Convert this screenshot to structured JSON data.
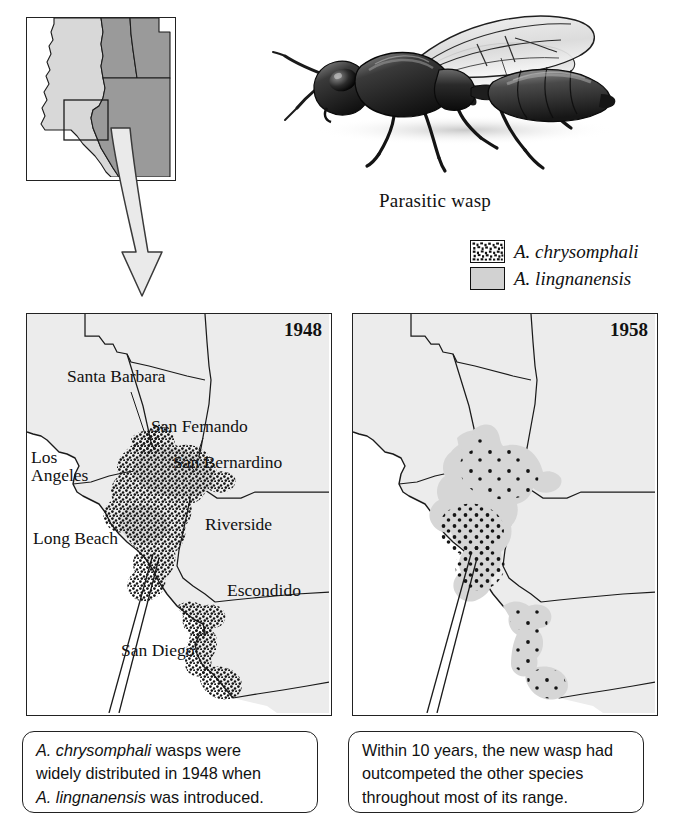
{
  "figure": {
    "type": "two-panel distribution map with inset locator and illustration"
  },
  "illustration": {
    "name": "parasitic-wasp-drawing",
    "caption": "Parasitic wasp"
  },
  "legend": {
    "items": [
      {
        "swatch": "stipple-pattern",
        "label": "A. chrysomphali"
      },
      {
        "swatch": "gray-fill",
        "label": "A. lingnanensis"
      }
    ]
  },
  "locator_map": {
    "name": "southwest-us-locator",
    "inset_box": "southern California study area",
    "states": [
      "California",
      "Nevada",
      "Utah",
      "Arizona"
    ]
  },
  "panels": [
    {
      "id": "panel-1948",
      "year": "1948",
      "cities": [
        {
          "label": "Santa Barbara",
          "x": 40,
          "y": 57
        },
        {
          "label": "San Fernando",
          "x": 125,
          "y": 107
        },
        {
          "label": "San Bernardino",
          "x": 145,
          "y": 142
        },
        {
          "label": "Los Angeles",
          "x": 4,
          "y": 142,
          "two_line": true,
          "line1": "Los",
          "line2": "Angeles"
        },
        {
          "label": "Riverside",
          "x": 178,
          "y": 206
        },
        {
          "label": "Long Beach",
          "x": 8,
          "y": 220
        },
        {
          "label": "Escondido",
          "x": 200,
          "y": 272
        },
        {
          "label": "San Diego",
          "x": 94,
          "y": 332
        }
      ],
      "species_shown": [
        "A. chrysomphali"
      ],
      "distribution_note": "dense stipple covering the Los Angeles basin, inland valleys, Escondido and San Diego coastal strip"
    },
    {
      "id": "panel-1958",
      "year": "1958",
      "cities": [],
      "species_shown": [
        "A. lingnanensis",
        "A. chrysomphali"
      ],
      "distribution_note": "gray fill of A. lingnanensis across the whole former range with only scattered remnant dots of A. chrysomphali"
    }
  ],
  "callouts": [
    {
      "id": "callout-left",
      "lines": [
        {
          "italic": "A. chrysomphali",
          "rest": " wasps were"
        },
        {
          "italic": "",
          "rest": "widely distributed in 1948 when"
        },
        {
          "italic": "A. lingnanensis",
          "rest": " was introduced."
        }
      ]
    },
    {
      "id": "callout-right",
      "lines": [
        {
          "italic": "",
          "rest": "Within 10 years, the new wasp had"
        },
        {
          "italic": "",
          "rest": "outcompeted the other species"
        },
        {
          "italic": "",
          "rest": "throughout most of its range."
        }
      ]
    }
  ],
  "colors": {
    "land": "#ececec",
    "ocean": "#ffffff",
    "lingnanensis_fill": "#d2d2d2",
    "chrysomphali_dot": "#111111",
    "border": "#222222",
    "locator_other_states": "#9a9a9a",
    "locator_california": "#d8d8d8",
    "arrow_fill": "#e8e8e8"
  }
}
